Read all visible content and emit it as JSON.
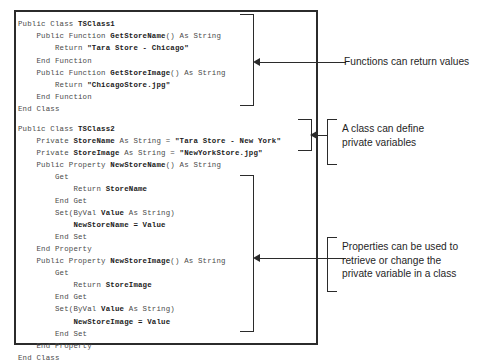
{
  "figure": {
    "type": "annotated-code-listing",
    "language": "Visual Basic .NET"
  },
  "code": {
    "lines": [
      {
        "indent": 0,
        "segments": [
          {
            "t": "Public Class ",
            "bold": false
          },
          {
            "t": "TSClass1",
            "bold": true
          }
        ]
      },
      {
        "indent": 0,
        "segments": [
          {
            "t": "    Public Function ",
            "bold": false
          },
          {
            "t": "GetStoreName",
            "bold": true
          },
          {
            "t": "() As String",
            "bold": false
          }
        ]
      },
      {
        "indent": 0,
        "segments": [
          {
            "t": "        Return ",
            "bold": false
          },
          {
            "t": "\"Tara Store - Chicago\"",
            "bold": true
          }
        ]
      },
      {
        "indent": 0,
        "segments": [
          {
            "t": "    End Function",
            "bold": false
          }
        ]
      },
      {
        "indent": 0,
        "segments": [
          {
            "t": "    Public Function ",
            "bold": false
          },
          {
            "t": "GetStoreImage",
            "bold": true
          },
          {
            "t": "() As String",
            "bold": false
          }
        ]
      },
      {
        "indent": 0,
        "segments": [
          {
            "t": "        Return ",
            "bold": false
          },
          {
            "t": "\"ChicagoStore.jpg\"",
            "bold": true
          }
        ]
      },
      {
        "indent": 0,
        "segments": [
          {
            "t": "    End Function",
            "bold": false
          }
        ]
      },
      {
        "indent": 0,
        "segments": [
          {
            "t": "End Class",
            "bold": false
          }
        ]
      },
      {
        "blank": true,
        "segments": []
      },
      {
        "indent": 0,
        "segments": [
          {
            "t": "Public Class ",
            "bold": false
          },
          {
            "t": "TSClass2",
            "bold": true
          }
        ]
      },
      {
        "indent": 0,
        "segments": [
          {
            "t": "    Private ",
            "bold": false
          },
          {
            "t": "StoreName",
            "bold": true
          },
          {
            "t": " As String = ",
            "bold": false
          },
          {
            "t": "\"Tara Store - New York\"",
            "bold": true
          }
        ]
      },
      {
        "indent": 0,
        "segments": [
          {
            "t": "    Private ",
            "bold": false
          },
          {
            "t": "StoreImage",
            "bold": true
          },
          {
            "t": " As String = ",
            "bold": false
          },
          {
            "t": "\"NewYorkStore.jpg\"",
            "bold": true
          }
        ]
      },
      {
        "indent": 0,
        "segments": [
          {
            "t": "    Public Property ",
            "bold": false
          },
          {
            "t": "NewStoreName",
            "bold": true
          },
          {
            "t": "() As String",
            "bold": false
          }
        ]
      },
      {
        "indent": 0,
        "segments": [
          {
            "t": "        Get",
            "bold": false
          }
        ]
      },
      {
        "indent": 0,
        "segments": [
          {
            "t": "            Return ",
            "bold": false
          },
          {
            "t": "StoreName",
            "bold": true
          }
        ]
      },
      {
        "indent": 0,
        "segments": [
          {
            "t": "        End Get",
            "bold": false
          }
        ]
      },
      {
        "indent": 0,
        "segments": [
          {
            "t": "        Set(ByVal ",
            "bold": false
          },
          {
            "t": "Value",
            "bold": true
          },
          {
            "t": " As String)",
            "bold": false
          }
        ]
      },
      {
        "indent": 0,
        "segments": [
          {
            "t": "            ",
            "bold": false
          },
          {
            "t": "NewStoreName = Value",
            "bold": true
          }
        ]
      },
      {
        "indent": 0,
        "segments": [
          {
            "t": "        End Set",
            "bold": false
          }
        ]
      },
      {
        "indent": 0,
        "segments": [
          {
            "t": "    End Property",
            "bold": false
          }
        ]
      },
      {
        "indent": 0,
        "segments": [
          {
            "t": "    Public Property ",
            "bold": false
          },
          {
            "t": "NewStoreImage",
            "bold": true
          },
          {
            "t": "() As String",
            "bold": false
          }
        ]
      },
      {
        "indent": 0,
        "segments": [
          {
            "t": "        Get",
            "bold": false
          }
        ]
      },
      {
        "indent": 0,
        "segments": [
          {
            "t": "            Return ",
            "bold": false
          },
          {
            "t": "StoreImage",
            "bold": true
          }
        ]
      },
      {
        "indent": 0,
        "segments": [
          {
            "t": "        End Get",
            "bold": false
          }
        ]
      },
      {
        "indent": 0,
        "segments": [
          {
            "t": "        Set(ByVal ",
            "bold": false
          },
          {
            "t": "Value",
            "bold": true
          },
          {
            "t": " As String)",
            "bold": false
          }
        ]
      },
      {
        "indent": 0,
        "segments": [
          {
            "t": "            ",
            "bold": false
          },
          {
            "t": "NewStoreImage = Value",
            "bold": true
          }
        ]
      },
      {
        "indent": 0,
        "segments": [
          {
            "t": "        End Set",
            "bold": false
          }
        ]
      },
      {
        "indent": 0,
        "segments": [
          {
            "t": "    End Property",
            "bold": false
          }
        ]
      },
      {
        "indent": 0,
        "segments": [
          {
            "t": "End Class",
            "bold": false
          }
        ]
      }
    ]
  },
  "annotations": [
    {
      "id": "functions-return-values",
      "text": "Functions can return values"
    },
    {
      "id": "class-private-variables",
      "text": "A class can define\nprivate variables"
    },
    {
      "id": "properties-retrieve-change",
      "text": "Properties can be used to\nretrieve or change the\nprivate variable in a class"
    }
  ],
  "colors": {
    "border": "#2b2b2b",
    "code_text": "#4a4a4a",
    "code_bold": "#1c1c1c",
    "annotation_text": "#1f1f1f",
    "background": "#ffffff"
  }
}
